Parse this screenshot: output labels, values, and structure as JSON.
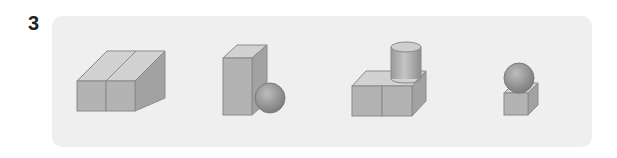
{
  "question": {
    "number": "3"
  },
  "panel": {
    "background": "#efefef"
  },
  "figures": [
    {
      "id": "two-cuboids",
      "description": "two rectangular prisms side by side"
    },
    {
      "id": "tall-prism-sphere",
      "description": "tall rectangular prism with a sphere beside it"
    },
    {
      "id": "cubes-cylinder",
      "description": "two cubes with a cylinder on top"
    },
    {
      "id": "cube-sphere",
      "description": "cube with a sphere on top"
    }
  ],
  "colors": {
    "front": "#b3b3b3",
    "top": "#d2d2d2",
    "side": "#a2a2a2",
    "edge": "#8a8a8a"
  }
}
